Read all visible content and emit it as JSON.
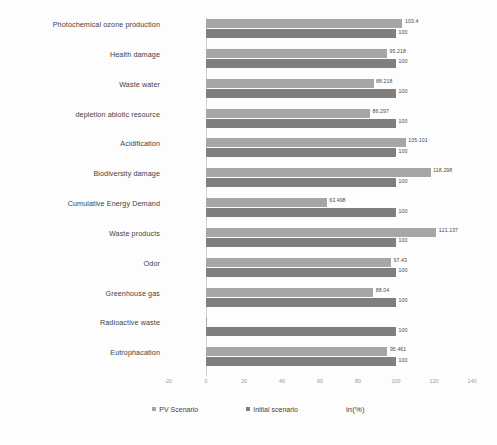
{
  "chart_data": {
    "type": "bar",
    "orientation": "horizontal",
    "title": "",
    "xlabel": "in(%)",
    "ylabel": "",
    "xlim": [
      -20,
      140
    ],
    "xticks": [
      -20,
      0,
      20,
      40,
      60,
      80,
      100,
      120,
      140
    ],
    "grid": false,
    "legend_position": "bottom",
    "categories": [
      "Photochemical ozone production",
      "Health damage",
      "Waste water",
      "depletion abiotic resource",
      "Acidification",
      "Biodiversity damage",
      "Cumulative Energy Demand",
      "Waste products",
      "Odor",
      "Greenhouse gas",
      "Radioactive waste",
      "Eutrophacation"
    ],
    "series": [
      {
        "name": "PV Scenario",
        "color": "#a6a6a6",
        "values": [
          103.4,
          95.218,
          88.218,
          86.297,
          105.101,
          118.298,
          63.498,
          121.137,
          97.43,
          88.04,
          0.3,
          95.461
        ],
        "labels": [
          "103.4",
          "95.218",
          "88.218",
          "86.297",
          "105.101",
          "118.298",
          "63.498",
          "121.137",
          "97.43",
          "88.04",
          "",
          "95.461"
        ]
      },
      {
        "name": "Initial scenario",
        "color": "#7f7f7f",
        "values": [
          100,
          100,
          100,
          100,
          100,
          100,
          100,
          100,
          100,
          100,
          100,
          100
        ],
        "labels": [
          "100",
          "100",
          "100",
          "100",
          "100",
          "100",
          "100",
          "100",
          "100",
          "100",
          "100",
          "100"
        ]
      }
    ]
  },
  "legend": {
    "items": [
      {
        "label": "PV Scenario"
      },
      {
        "label": "Initial scenario"
      }
    ],
    "unit_note": "in(%)"
  },
  "colors": {
    "pv_scenario": "#a6a6a6",
    "initial_scenario": "#7f7f7f",
    "axis": "#d2d2d2",
    "tick_text": "#9a9a9a",
    "label_text": "#3f3f3f"
  }
}
